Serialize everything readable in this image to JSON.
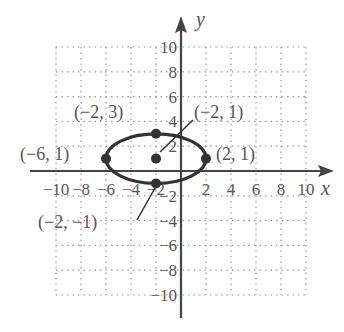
{
  "chart_data": {
    "type": "scatter",
    "title": "",
    "xlabel": "x",
    "ylabel": "y",
    "xlim": [
      -10,
      10
    ],
    "ylim": [
      -10,
      10
    ],
    "grid": true,
    "grid_step": 2,
    "x_ticks": [
      "-10",
      "-8",
      "-6",
      "-4",
      "-2",
      "2",
      "4",
      "6",
      "8",
      "10"
    ],
    "y_ticks": [
      "10",
      "8",
      "6",
      "4",
      "2",
      "-2",
      "-4",
      "-6",
      "-8",
      "-10"
    ],
    "curve": {
      "kind": "ellipse",
      "center": [
        -2,
        1
      ],
      "semi_major_x": 4,
      "semi_minor_y": 2
    },
    "points": [
      {
        "x": -2,
        "y": 3,
        "label": "(−2, 3)"
      },
      {
        "x": -2,
        "y": 1,
        "label": "(−2, 1)"
      },
      {
        "x": -6,
        "y": 1,
        "label": "(−6, 1)"
      },
      {
        "x": 2,
        "y": 1,
        "label": "(2, 1)"
      },
      {
        "x": -2,
        "y": -1,
        "label": "(−2, −1)"
      }
    ]
  },
  "colors": {
    "curve": "#333333",
    "axis": "#444444",
    "grid": "#9a9a9a",
    "text": "#555555"
  }
}
